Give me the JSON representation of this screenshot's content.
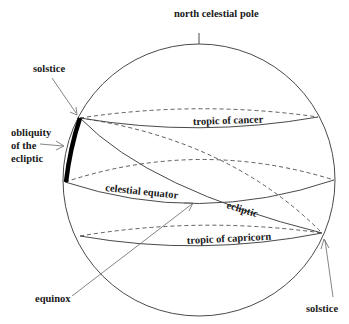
{
  "diagram": {
    "type": "celestial sphere",
    "labels": {
      "north_celestial_pole": "north celestial pole",
      "solstice_top": "solstice",
      "obliquity_line1": "obliquity",
      "obliquity_line2": "of the",
      "obliquity_line3": "ecliptic",
      "tropic_of_cancer": "tropic of cancer",
      "celestial_equator": "celestial equator",
      "ecliptic": "ecliptic",
      "tropic_of_capricorn": "tropic of capricorn",
      "equinox": "equinox",
      "solstice_bottom": "solstice"
    },
    "colors": {
      "stroke": "#4a4a4a",
      "text": "#1a1a1a",
      "obliquity_bar": "#000000",
      "background": "#ffffff"
    }
  }
}
